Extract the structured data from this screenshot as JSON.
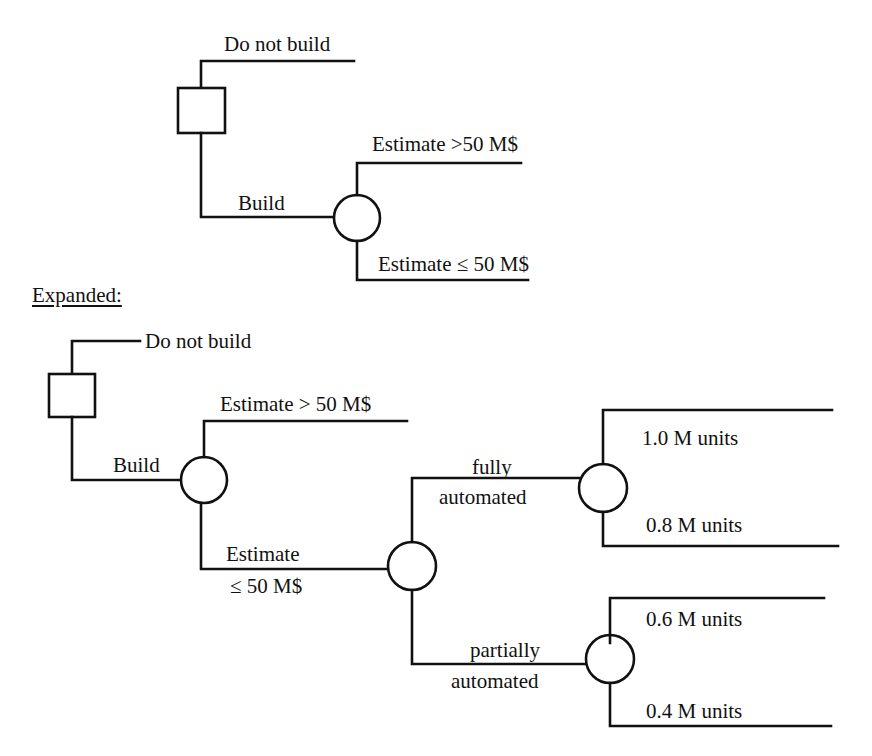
{
  "simple_tree": {
    "decision_node": "decision",
    "labels": {
      "do_not_build": "Do not build",
      "build": "Build",
      "estimate_high": "Estimate >50 M$",
      "estimate_low": "Estimate ≤ 50 M$"
    }
  },
  "expanded_heading": "Expanded:",
  "expanded_tree": {
    "labels": {
      "do_not_build": "Do not build",
      "build": "Build",
      "estimate_high": "Estimate > 50 M$",
      "estimate_low_line1": "Estimate",
      "estimate_low_line2": "≤ 50 M$",
      "fully_line1": "fully",
      "fully_line2": "automated",
      "partially_line1": "partially",
      "partially_line2": "automated",
      "units_1_0": "1.0 M units",
      "units_0_8": "0.8 M units",
      "units_0_6": "0.6 M units",
      "units_0_4": "0.4 M units"
    }
  }
}
